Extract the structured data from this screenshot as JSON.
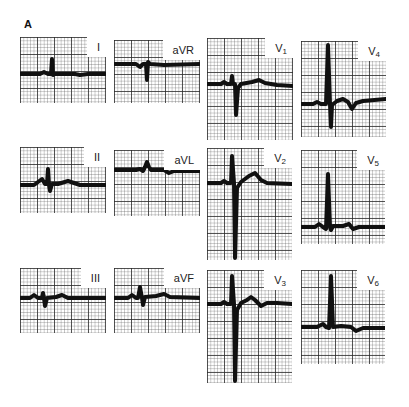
{
  "figure": {
    "panel_label": "A",
    "grid": {
      "major_px": 17,
      "minor_px": 3.4
    }
  },
  "leads": [
    {
      "id": "I",
      "name": "I",
      "sub": "",
      "x": 20,
      "y": 37,
      "w": 86,
      "h": 66,
      "baseline": 37,
      "trace": "M0,37 L20,37 L24,35 L28,37 L31,37 L32,22 L33,38 L35,37 L55,37 L60,38 L68,37 L86,37"
    },
    {
      "id": "aVR",
      "name": "aVR",
      "sub": "",
      "x": 114,
      "y": 40,
      "w": 86,
      "h": 63,
      "baseline": 24,
      "trace": "M0,24 L22,24 L26,27 L29,24 L32,24 L33,40 L34,22 L36,24 L50,25 L86,24"
    },
    {
      "id": "V1",
      "name": "V",
      "sub": "1",
      "x": 207,
      "y": 38,
      "w": 86,
      "h": 102,
      "baseline": 46,
      "trace": "M0,46 L14,46 L17,44 L20,46 L24,46 L25,38 L26,46 L28,46 L29,77 L31,50 L34,46 L45,44 L52,42 L58,45 L70,47 L86,48"
    },
    {
      "id": "V4",
      "name": "V",
      "sub": "4",
      "x": 301,
      "y": 41,
      "w": 85,
      "h": 96,
      "baseline": 63,
      "trace": "M0,63 L12,63 L16,61 L20,63 L25,63 L27,4 L29,63 L30,86 L31,64 L36,60 L42,58 L47,61 L51,68 L55,62 L62,60 L85,58"
    },
    {
      "id": "II",
      "name": "II",
      "sub": "",
      "x": 20,
      "y": 147,
      "w": 86,
      "h": 66,
      "baseline": 38,
      "trace": "M0,38 L14,38 L18,35 L22,32 L25,37 L27,37 L28,22 L29,38 L30,44 L32,37 L38,37 L48,34 L54,36 L60,38 L86,38"
    },
    {
      "id": "aVL",
      "name": "aVL",
      "sub": "",
      "x": 114,
      "y": 150,
      "w": 86,
      "h": 66,
      "baseline": 20,
      "trace": "M0,20 L22,20 L26,19 L29,21 L31,17 L33,12 L35,17 L37,20 L50,20 L55,23 L60,21 L86,21"
    },
    {
      "id": "V2",
      "name": "V",
      "sub": "2",
      "x": 207,
      "y": 148,
      "w": 85,
      "h": 112,
      "baseline": 35,
      "trace": "M0,35 L14,35 L17,33 L20,35 L24,35 L25,8 L27,35 L28,110 L30,40 L34,34 L42,28 L48,25 L54,32 L60,35 L85,36"
    },
    {
      "id": "V5",
      "name": "V",
      "sub": "5",
      "x": 301,
      "y": 150,
      "w": 84,
      "h": 94,
      "baseline": 77,
      "trace": "M0,77 L14,77 L18,74 L22,77 L25,79 L27,24 L29,77 L30,80 L32,76 L42,76 L48,74 L52,79 L58,77 L84,77"
    },
    {
      "id": "III",
      "name": "III",
      "sub": "",
      "x": 20,
      "y": 268,
      "w": 86,
      "h": 65,
      "baseline": 30,
      "trace": "M0,30 L10,30 L14,27 L18,30 L22,30 L23,25 L24,30 L25,38 L27,30 L36,29 L42,27 L48,30 L86,30"
    },
    {
      "id": "aVF",
      "name": "aVF",
      "sub": "",
      "x": 114,
      "y": 268,
      "w": 86,
      "h": 65,
      "baseline": 30,
      "trace": "M0,30 L14,30 L18,27 L22,30 L24,30 L26,19 L28,30 L29,37 L31,29 L42,28 L50,26 L56,29 L86,30"
    },
    {
      "id": "V3",
      "name": "V",
      "sub": "3",
      "x": 207,
      "y": 270,
      "w": 85,
      "h": 113,
      "baseline": 34,
      "trace": "M0,34 L14,34 L17,32 L20,34 L24,34 L25,6 L27,34 L28,111 L30,40 L34,33 L40,30 L44,27 L48,30 L54,36 L60,33 L70,33 L85,34"
    },
    {
      "id": "V6",
      "name": "V",
      "sub": "6",
      "x": 301,
      "y": 270,
      "w": 84,
      "h": 94,
      "baseline": 57,
      "trace": "M0,57 L16,57 L22,54 L25,57 L28,58 L30,6 L32,57 L40,56 L50,57 L55,61 L62,58 L84,58"
    }
  ]
}
